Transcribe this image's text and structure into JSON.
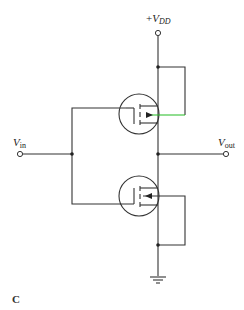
{
  "diagram": {
    "type": "CMOS inverter schematic",
    "figure_label": "C",
    "labels": {
      "vdd_prefix": "+",
      "vdd_main": "V",
      "vdd_sub": "DD",
      "vin_main": "V",
      "vin_sub": "in",
      "vout_main": "V",
      "vout_sub": "out"
    },
    "components": [
      {
        "id": "M1",
        "kind": "PMOS",
        "position": "upper",
        "bulk": "tied to source (VDD)"
      },
      {
        "id": "M2",
        "kind": "NMOS",
        "position": "lower",
        "bulk": "tied to source (ground)"
      }
    ],
    "nodes": [
      "VDD",
      "Vin",
      "Vout",
      "GND"
    ],
    "colors": {
      "wire": "#333333",
      "highlight_wire": "#22bb22",
      "background": "#ffffff"
    }
  }
}
